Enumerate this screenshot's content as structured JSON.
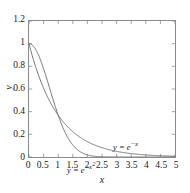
{
  "chart_data": {
    "type": "line",
    "title": "",
    "subtitle": "",
    "xlabel": "x",
    "ylabel": "y",
    "xlim": [
      0,
      5
    ],
    "ylim": [
      0,
      1.2
    ],
    "grid": false,
    "legend_position": "inline-annotations",
    "xticks": [
      0,
      0.5,
      1,
      1.5,
      2,
      2.5,
      3,
      3.5,
      4,
      4.5,
      5
    ],
    "xtick_labels": [
      "0",
      "0.5",
      "1",
      "1.5",
      "2",
      "2.5",
      "3",
      "3.5",
      "4",
      "4.5",
      "5"
    ],
    "yticks": [
      0,
      0.2,
      0.4,
      0.6,
      0.8,
      1,
      1.2
    ],
    "ytick_labels": [
      "0",
      "0.2",
      "0.4",
      "0.6",
      "0.8",
      "1",
      "1.2"
    ],
    "line_color": "#6e6e6e",
    "frame_color": "#8a8a8a",
    "text_color": "#1a1a1a",
    "series": [
      {
        "name": "y = e^-x",
        "label_base": "y = e",
        "label_exponent": "−x",
        "annotation_x": 2.2,
        "annotation_y": 0.24,
        "x": [
          0,
          0.25,
          0.5,
          0.75,
          1,
          1.25,
          1.5,
          1.75,
          2,
          2.25,
          2.5,
          2.75,
          3,
          3.25,
          3.5,
          3.75,
          4,
          4.25,
          4.5,
          4.75,
          5
        ],
        "values": [
          1,
          0.7788,
          0.6065,
          0.4724,
          0.3679,
          0.2865,
          0.2231,
          0.1738,
          0.1353,
          0.1054,
          0.0821,
          0.0639,
          0.0498,
          0.0388,
          0.0302,
          0.0235,
          0.0183,
          0.0143,
          0.0111,
          0.0087,
          0.0067
        ]
      },
      {
        "name": "y = e^-x^2",
        "label_base": "y = e",
        "label_exponent": "−x",
        "label_exponent_power": "2",
        "annotation_x": 0.45,
        "annotation_y": 0.11,
        "x": [
          0,
          0.25,
          0.5,
          0.75,
          1,
          1.25,
          1.5,
          1.75,
          2,
          2.25,
          2.5,
          2.75,
          3,
          3.25,
          3.5,
          3.75,
          4,
          4.25,
          4.5,
          4.75,
          5
        ],
        "values": [
          1,
          0.9394,
          0.7788,
          0.5698,
          0.3679,
          0.2096,
          0.1054,
          0.0468,
          0.0183,
          0.0063,
          0.0019,
          0.0005,
          0.0001,
          0.0,
          0.0,
          0.0,
          0.0,
          0.0,
          0.0,
          0.0,
          0.0
        ]
      }
    ],
    "intersection": {
      "x": 1,
      "y": 0.3679
    }
  }
}
